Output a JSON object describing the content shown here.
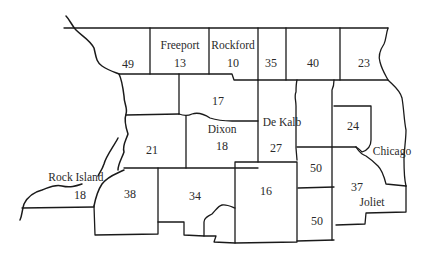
{
  "map": {
    "type": "district map",
    "stroke_color": "#1a1a1a",
    "background": "#ffffff",
    "regions": [
      {
        "id": "r49",
        "city": "",
        "value": "49"
      },
      {
        "id": "r13",
        "city": "Freeport",
        "value": "13"
      },
      {
        "id": "r10",
        "city": "Rockford",
        "value": "10"
      },
      {
        "id": "r35",
        "city": "",
        "value": "35"
      },
      {
        "id": "r40",
        "city": "",
        "value": "40"
      },
      {
        "id": "r23",
        "city": "",
        "value": "23"
      },
      {
        "id": "r17",
        "city": "",
        "value": "17"
      },
      {
        "id": "r21",
        "city": "",
        "value": "21"
      },
      {
        "id": "r18dixon",
        "city": "Dixon",
        "value": "18"
      },
      {
        "id": "r27",
        "city": "De Kalb",
        "value": "27"
      },
      {
        "id": "r24",
        "city": "",
        "value": "24"
      },
      {
        "id": "rchicago",
        "city": "Chicago",
        "value": ""
      },
      {
        "id": "r18rock",
        "city": "Rock Island",
        "value": "18"
      },
      {
        "id": "r38",
        "city": "",
        "value": "38"
      },
      {
        "id": "r34",
        "city": "",
        "value": "34"
      },
      {
        "id": "r16",
        "city": "Streator",
        "value": "16"
      },
      {
        "id": "r50a",
        "city": "",
        "value": "50"
      },
      {
        "id": "r50b",
        "city": "",
        "value": "50"
      },
      {
        "id": "r37",
        "city": "Joliet",
        "value": "37"
      }
    ]
  }
}
